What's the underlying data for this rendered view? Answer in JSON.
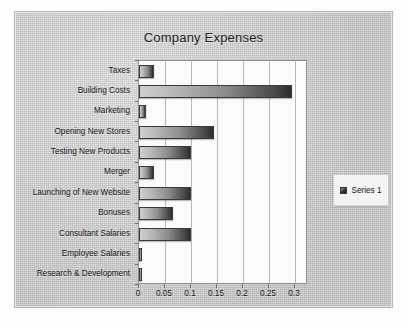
{
  "chart_data": {
    "type": "bar",
    "orientation": "horizontal",
    "title": "Company Expenses",
    "xlabel": "",
    "ylabel": "",
    "xlim": [
      0,
      0.325
    ],
    "xticks": [
      "0",
      "0.05",
      "0.1",
      "0.15",
      "0.2",
      "0.25",
      "0.3"
    ],
    "xtick_values": [
      0,
      0.05,
      0.1,
      0.15,
      0.2,
      0.25,
      0.3
    ],
    "grid": "vertical",
    "legend_position": "right",
    "categories": [
      "Taxes",
      "Building Costs",
      "Marketing",
      "Opening New Stores",
      "Testing New Products",
      "Merger",
      "Launching of New Website",
      "Bonuses",
      "Consultant Salaries",
      "Employee Salaries",
      "Research & Development"
    ],
    "series": [
      {
        "name": "Series 1",
        "values": [
          0.028,
          0.295,
          0.013,
          0.145,
          0.1,
          0.028,
          0.1,
          0.065,
          0.1,
          0.002,
          0.002
        ]
      }
    ],
    "colors": {
      "bar_light": "#cfcfcf",
      "bar_dark": "#2d2d2d",
      "bar_border": "#3a3a3a",
      "plot_background": "#fbfbfb",
      "card_background": "#d2d2d2",
      "gridline": "#b9b9b9",
      "text": "#141414"
    }
  },
  "legend": {
    "items": [
      {
        "label": "Series 1",
        "swatch_name": "series-1-swatch"
      }
    ]
  }
}
